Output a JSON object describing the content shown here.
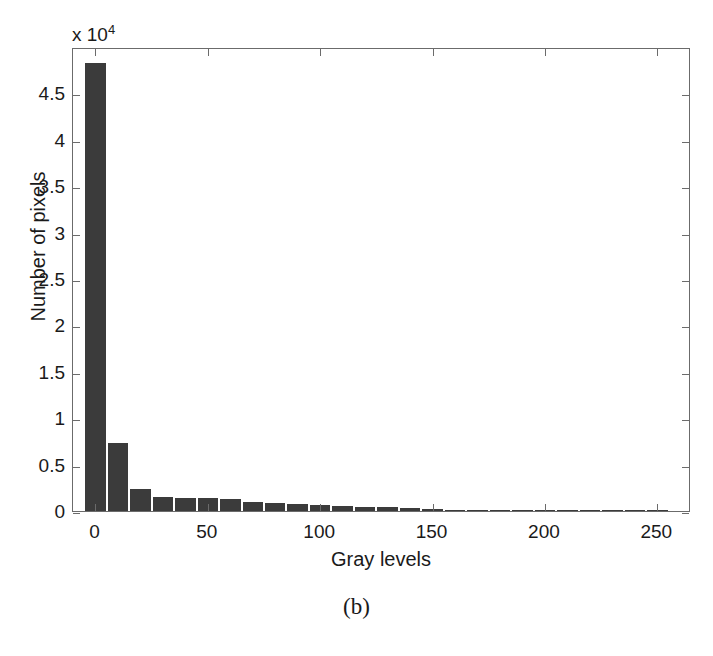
{
  "figure": {
    "caption": "(b)",
    "exponent_prefix": "x 10",
    "exponent_power": "4",
    "bar_color": "#3b3b3b",
    "axis_color": "#6b6b6b",
    "background": "#ffffff"
  },
  "chart_data": {
    "type": "bar",
    "title": "",
    "subtitle": "",
    "xlabel": "Gray levels",
    "ylabel": "Number of pixels",
    "y_exponent_label": "x 10^4",
    "y_scale_factor": 10000,
    "xlim": [
      -10,
      265
    ],
    "ylim": [
      0,
      5.0
    ],
    "grid": false,
    "legend": null,
    "xticks": [
      0,
      50,
      100,
      150,
      200,
      250
    ],
    "xtick_labels": [
      "0",
      "50",
      "100",
      "150",
      "200",
      "250"
    ],
    "yticks": [
      0,
      0.5,
      1,
      1.5,
      2,
      2.5,
      3,
      3.5,
      4,
      4.5
    ],
    "ytick_labels": [
      "0",
      "0.5",
      "1",
      "1.5",
      "2",
      "2.5",
      "3",
      "3.5",
      "4",
      "4.5"
    ],
    "bin_width": 10,
    "categories": [
      0,
      10,
      20,
      30,
      40,
      50,
      60,
      70,
      80,
      90,
      100,
      110,
      120,
      130,
      140,
      150,
      160,
      170,
      180,
      190,
      200,
      210,
      220,
      230,
      240,
      250
    ],
    "values": [
      4.83,
      0.73,
      0.24,
      0.155,
      0.145,
      0.135,
      0.125,
      0.095,
      0.085,
      0.075,
      0.06,
      0.05,
      0.045,
      0.04,
      0.03,
      0.022,
      0.016,
      0.012,
      0.01,
      0.009,
      0.008,
      0.007,
      0.006,
      0.005,
      0.004,
      0.003
    ],
    "values_note": "heights in units of 10^4 pixels"
  }
}
